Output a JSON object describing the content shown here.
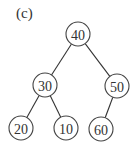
{
  "figure_label": "(c)",
  "tree": {
    "nodes": [
      {
        "id": "n40",
        "value": "40",
        "x": 78,
        "y": 34
      },
      {
        "id": "n30",
        "value": "30",
        "x": 45,
        "y": 85
      },
      {
        "id": "n50",
        "value": "50",
        "x": 117,
        "y": 86
      },
      {
        "id": "n20",
        "value": "20",
        "x": 21,
        "y": 128
      },
      {
        "id": "n10",
        "value": "10",
        "x": 66,
        "y": 128
      },
      {
        "id": "n60",
        "value": "60",
        "x": 101,
        "y": 129
      }
    ],
    "edges": [
      {
        "from": "n40",
        "to": "n30"
      },
      {
        "from": "n40",
        "to": "n50"
      },
      {
        "from": "n30",
        "to": "n20"
      },
      {
        "from": "n30",
        "to": "n10"
      },
      {
        "from": "n50",
        "to": "n60"
      }
    ]
  }
}
